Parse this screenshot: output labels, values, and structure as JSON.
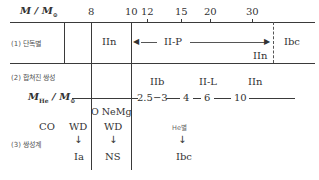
{
  "axis": {
    "title_main": "M / M",
    "title_sun": "⊙",
    "ticks": [
      {
        "label": "8",
        "x": 91
      },
      {
        "label": "10",
        "x": 131
      },
      {
        "label": "12",
        "x": 147
      },
      {
        "label": "15",
        "x": 181
      },
      {
        "label": "20",
        "x": 210
      },
      {
        "label": "30",
        "x": 252
      }
    ]
  },
  "row1": {
    "label": "(1) 단독별",
    "iin_left": "IIn",
    "iip": "II-P",
    "iin_right": "IIn",
    "ibc": "Ibc"
  },
  "row2": {
    "label": "(2) 합쳐진 쌍성",
    "types": {
      "iib": "IIb",
      "iil": "II-L",
      "iin": "IIn"
    },
    "he_axis_title": "M",
    "he_axis_sub": "He",
    "he_axis_sun": "⊙",
    "he_ticks": {
      "t1": "2.5−3",
      "t2": "4",
      "t3": "6",
      "t4": "10"
    }
  },
  "row3": {
    "label": "(3) 쌍성계",
    "co": "CO",
    "onemg": "O NeMg",
    "wd1": "WD",
    "wd2": "WD",
    "ia": "Ia",
    "ns": "NS",
    "he_star": "He별",
    "ibc": "Ibc",
    "arrow": "↓"
  }
}
